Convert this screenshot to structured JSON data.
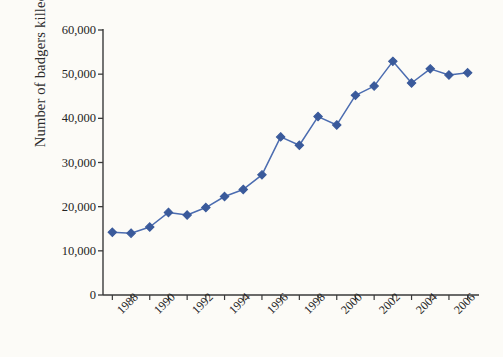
{
  "chart_data": {
    "type": "line",
    "title": "",
    "subtitle": "",
    "xlabel": "",
    "ylabel": "Number of badgers killed",
    "x": [
      1987,
      1988,
      1989,
      1990,
      1991,
      1992,
      1993,
      1994,
      1995,
      1996,
      1997,
      1998,
      1999,
      2000,
      2001,
      2002,
      2003,
      2004,
      2005,
      2006
    ],
    "values": [
      14200,
      14000,
      15400,
      18700,
      18100,
      19800,
      22300,
      23900,
      27200,
      35800,
      33900,
      40400,
      38500,
      45200,
      47300,
      52900,
      48000,
      51200,
      49800,
      50300
    ],
    "series": [
      {
        "name": "Number of badgers killed",
        "values": [
          14200,
          14000,
          15400,
          18700,
          18100,
          19800,
          22300,
          23900,
          27200,
          35800,
          33900,
          40400,
          38500,
          45200,
          47300,
          52900,
          48000,
          51200,
          49800,
          50300
        ]
      }
    ],
    "xlim": [
      1986.5,
      2006.5
    ],
    "ylim": [
      0,
      60000
    ],
    "yticks": [
      0,
      10000,
      20000,
      30000,
      40000,
      50000,
      60000
    ],
    "ytick_labels": [
      "0",
      "10,000",
      "20,000",
      "30,000",
      "40,000",
      "50,000",
      "60,000"
    ],
    "xticks": [
      1987,
      1988,
      1989,
      1990,
      1991,
      1992,
      1993,
      1994,
      1995,
      1996,
      1997,
      1998,
      1999,
      2000,
      2001,
      2002,
      2003,
      2004,
      2005,
      2006
    ],
    "xtick_labels": [
      "",
      "1988",
      "",
      "1990",
      "",
      "1992",
      "",
      "1994",
      "",
      "1996",
      "",
      "1998",
      "",
      "2000",
      "",
      "2002",
      "",
      "2004",
      "",
      "2006"
    ],
    "grid": false,
    "legend": false,
    "legend_position": "none",
    "marker": "diamond",
    "colors": {
      "line": "#4b6cb0",
      "marker": "#3a5a9b",
      "axis": "#3a3a3a",
      "text": "#242424",
      "background": "#fcfbf7"
    }
  }
}
